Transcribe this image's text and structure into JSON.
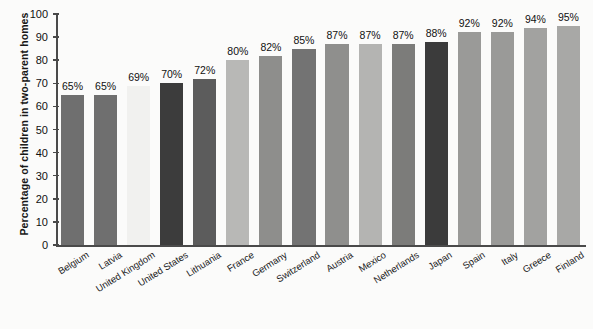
{
  "chart_data": {
    "type": "bar",
    "title": "",
    "xlabel": "",
    "ylabel": "Percentage of children in two-parent homes",
    "ylim": [
      0,
      100
    ],
    "yticks": [
      0,
      10,
      20,
      30,
      40,
      50,
      60,
      70,
      80,
      90,
      100
    ],
    "ytick_labels": [
      "0",
      "10",
      "20",
      "30",
      "40",
      "50",
      "60",
      "70",
      "80",
      "90",
      "100"
    ],
    "grid": false,
    "legend": "none",
    "value_suffix": "%",
    "categories": [
      "Belgium",
      "Latvia",
      "United Kingdom",
      "United States",
      "Lithuania",
      "France",
      "Germany",
      "Switzerland",
      "Austria",
      "Mexico",
      "Netherlands",
      "Japan",
      "Spain",
      "Italy",
      "Greece",
      "Finland"
    ],
    "values": [
      65,
      65,
      69,
      70,
      72,
      80,
      82,
      85,
      87,
      87,
      87,
      88,
      92,
      92,
      94,
      95
    ],
    "value_labels": [
      "65%",
      "65%",
      "69%",
      "70%",
      "72%",
      "80%",
      "82%",
      "85%",
      "87%",
      "87%",
      "87%",
      "88%",
      "92%",
      "92%",
      "94%",
      "95%"
    ],
    "bar_colors": [
      "#6f6f6f",
      "#6f6f6f",
      "#f1f1ef",
      "#3c3c3c",
      "#5c5c5c",
      "#b8b8b6",
      "#8e8e8c",
      "#737373",
      "#8f8f8d",
      "#b4b4b2",
      "#7c7c7a",
      "#3b3b3b",
      "#9a9a98",
      "#9a9a98",
      "#a2a2a0",
      "#a8a8a6"
    ]
  },
  "colors": {
    "background": "#fbfbfa",
    "axis": "#4a4a4a",
    "text": "#111111"
  }
}
